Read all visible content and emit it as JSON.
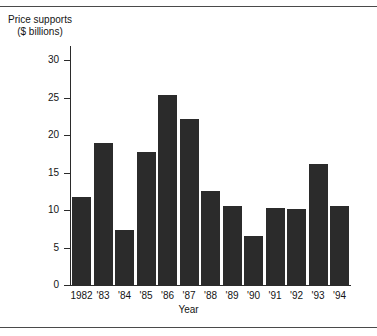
{
  "figure": {
    "y_caption_line1": "Price supports",
    "y_caption_line2": "($ billions)",
    "x_title": "Year",
    "bar_color": "#2b2b2b",
    "axis_color": "#2b2b2b",
    "background_color": "#ffffff",
    "rule_color": "#4a4a4a"
  },
  "chart_data": {
    "type": "bar",
    "title": "Price supports ($ billions)",
    "xlabel": "Year",
    "ylabel": "Price supports ($ billions)",
    "categories": [
      "1982",
      "'83",
      "'84",
      "'85",
      "'86",
      "'87",
      "'88",
      "'89",
      "'90",
      "'91",
      "'92",
      "'93",
      "'94"
    ],
    "values": [
      11.8,
      19.0,
      7.4,
      17.8,
      25.3,
      22.2,
      12.5,
      10.6,
      6.6,
      10.3,
      10.1,
      16.2,
      10.5
    ],
    "ylim": [
      0,
      32
    ],
    "yticks": [
      0,
      5,
      10,
      15,
      20,
      25,
      30
    ],
    "ytick_labels": [
      "0",
      "5",
      "10",
      "15",
      "20",
      "25",
      "30"
    ],
    "grid": false,
    "legend": null,
    "legend_position": "none"
  }
}
